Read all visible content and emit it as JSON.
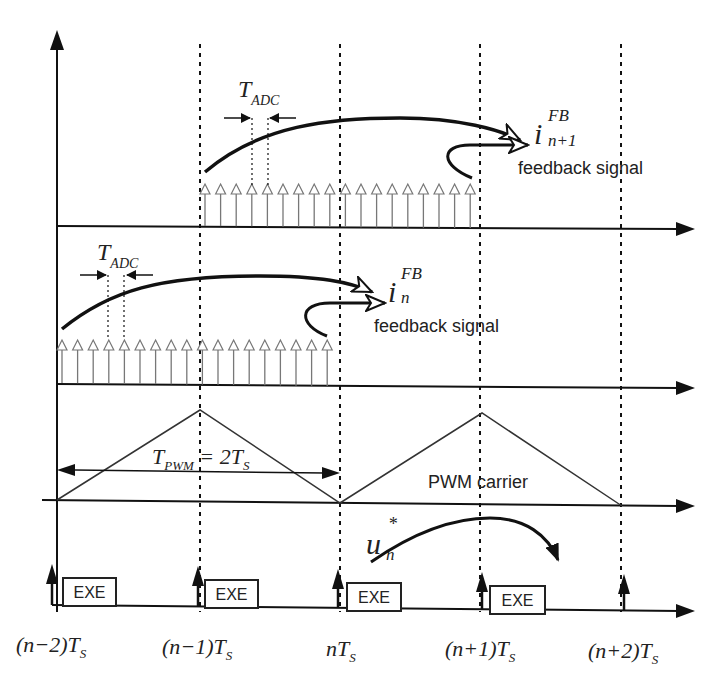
{
  "diagram": {
    "colors": {
      "line": "#111111",
      "sample_arrow": "#777777",
      "carrier": "#333333",
      "background": "#ffffff"
    },
    "row1": {
      "tadc_label_main": "T",
      "tadc_label_sub": "ADC",
      "feedback_symbol": "i",
      "feedback_sup": "FB",
      "feedback_sub": "n+1",
      "feedback_text": "feedback signal",
      "sample_count": 18
    },
    "row2": {
      "tadc_label_main": "T",
      "tadc_label_sub": "ADC",
      "feedback_symbol": "i",
      "feedback_sup": "FB",
      "feedback_sub": "n",
      "feedback_text": "feedback signal",
      "sample_count": 18
    },
    "row3": {
      "tpwm_main": "T",
      "tpwm_sub": "PWM",
      "tpwm_eq": " = 2T",
      "tpwm_eq_sub": "S",
      "carrier_label": "PWM carrier"
    },
    "row4": {
      "u_symbol": "u",
      "u_sup": "*",
      "u_sub": "n",
      "exe_label": "EXE",
      "exe_blocks": [
        "EXE",
        "EXE",
        "EXE",
        "EXE"
      ]
    },
    "time_ticks": [
      {
        "main": "(n−2)T",
        "sub": "S"
      },
      {
        "main": "(n−1)T",
        "sub": "S"
      },
      {
        "main": "nT",
        "sub": "S"
      },
      {
        "main": "(n+1)T",
        "sub": "S"
      },
      {
        "main": "(n+2)T",
        "sub": "S"
      }
    ]
  }
}
